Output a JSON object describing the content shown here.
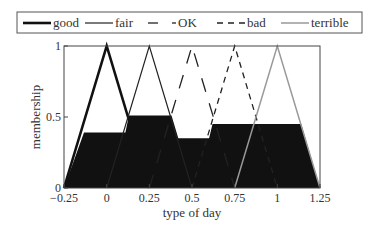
{
  "chart_data": {
    "type": "line",
    "title": "",
    "xlabel": "type of day",
    "ylabel": "membership",
    "xlim": [
      -0.25,
      1.25
    ],
    "ylim": [
      0,
      1
    ],
    "xticks": [
      -0.25,
      0,
      0.25,
      0.5,
      0.75,
      1,
      1.25
    ],
    "xtick_labels": [
      "−0.25",
      "0",
      "0.25",
      "0.5",
      "0.75",
      "1",
      "1.25"
    ],
    "yticks": [
      0,
      0.5,
      1
    ],
    "ytick_labels": [
      "0",
      "0.5",
      "1"
    ],
    "grid": false,
    "legend_position": "top",
    "series": [
      {
        "name": "good",
        "style": "solid-thick",
        "color": "#111111",
        "x": [
          -0.25,
          0,
          0.25
        ],
        "y": [
          0,
          1,
          0
        ]
      },
      {
        "name": "fair",
        "style": "solid-thin",
        "color": "#222222",
        "x": [
          0,
          0.25,
          0.5
        ],
        "y": [
          0,
          1,
          0
        ]
      },
      {
        "name": "OK",
        "style": "long-dash",
        "color": "#222222",
        "x": [
          0.25,
          0.5,
          0.75
        ],
        "y": [
          0,
          1,
          0
        ]
      },
      {
        "name": "bad",
        "style": "dashed",
        "color": "#222222",
        "x": [
          0.5,
          0.75,
          1
        ],
        "y": [
          0,
          1,
          0
        ]
      },
      {
        "name": "terrible",
        "style": "solid-gray",
        "color": "#999999",
        "x": [
          0.75,
          1,
          1.25
        ],
        "y": [
          0,
          1,
          0
        ]
      }
    ],
    "aggregated_fill": {
      "description": "clipped and aggregated output membership (black area)",
      "color": "#111111",
      "x": [
        -0.25,
        -0.133,
        0.11,
        0.13,
        0.38,
        0.42,
        0.6,
        0.62,
        1.14,
        1.25
      ],
      "y": [
        0,
        0.39,
        0.39,
        0.51,
        0.51,
        0.35,
        0.35,
        0.45,
        0.45,
        0
      ]
    }
  }
}
